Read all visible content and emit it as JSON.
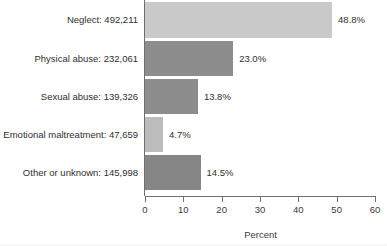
{
  "chart_data": {
    "type": "bar",
    "orientation": "horizontal",
    "title": "",
    "subtitle": "",
    "xlabel": "Percent",
    "ylabel": "",
    "xlim": [
      0,
      60
    ],
    "xticks": [
      0,
      10,
      20,
      30,
      40,
      50,
      60
    ],
    "xtick_labels": [
      "0",
      "10",
      "20",
      "30",
      "40",
      "50",
      "60"
    ],
    "grid": false,
    "legend": false,
    "legend_position": "none",
    "categories": [
      "Neglect: 492,211",
      "Physical abuse: 232,061",
      "Sexual abuse: 139,326",
      "Emotional maltreatment: 47,659",
      "Other or unknown: 145,998"
    ],
    "category_names": [
      "Neglect",
      "Physical abuse",
      "Sexual abuse",
      "Emotional maltreatment",
      "Other or unknown"
    ],
    "counts": [
      492211,
      232061,
      139326,
      47659,
      145998
    ],
    "values": [
      48.8,
      23.0,
      13.8,
      4.7,
      14.5
    ],
    "data_labels": [
      "48.8%",
      "23.0%",
      "13.8%",
      "4.7%",
      "14.5%"
    ],
    "bar_colors": [
      "#c9c9c9",
      "#8d8d8d",
      "#8d8d8d",
      "#bcbcbc",
      "#868686"
    ],
    "axis_color": "#6f6f6f",
    "text_color": "#2f2f2f",
    "background": "#ffffff",
    "bars": [
      {
        "label": "Neglect: 492,211",
        "value": 48.8,
        "data_label": "48.8%",
        "count": 492211,
        "color": "#c9c9c9",
        "top": 2,
        "height": 36
      },
      {
        "label": "Physical abuse: 232,061",
        "value": 23.0,
        "data_label": "23.0%",
        "count": 232061,
        "color": "#8d8d8d",
        "top": 41,
        "height": 35
      },
      {
        "label": "Sexual abuse: 139,326",
        "value": 13.8,
        "data_label": "13.8%",
        "count": 139326,
        "color": "#8d8d8d",
        "top": 79,
        "height": 35
      },
      {
        "label": "Emotional maltreatment: 47,659",
        "value": 4.7,
        "data_label": "4.7%",
        "count": 47659,
        "color": "#bcbcbc",
        "top": 117,
        "height": 35
      },
      {
        "label": "Other or unknown: 145,998",
        "value": 14.5,
        "data_label": "14.5%",
        "count": 145998,
        "color": "#868686",
        "top": 155,
        "height": 35
      }
    ]
  }
}
